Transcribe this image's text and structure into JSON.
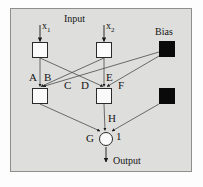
{
  "diagram": {
    "background_color": "#dededc",
    "line_color": "#4a4a4a",
    "node_fill": "#fbfbfb",
    "bias_fill": "#0a0a0a",
    "labels": {
      "input": "Input",
      "output": "Output",
      "bias": "Bias",
      "x1": "x",
      "x1_sub": "1",
      "x2": "x",
      "x2_sub": "2",
      "weight_a": "A",
      "weight_b": "B",
      "weight_c": "C",
      "weight_d": "D",
      "weight_e": "E",
      "weight_f": "F",
      "weight_g": "G",
      "weight_h": "H",
      "weight_one": "1"
    },
    "nodes": [
      {
        "id": "input-1",
        "type": "square",
        "x": 32,
        "y": 42,
        "w": 16,
        "h": 16
      },
      {
        "id": "input-2",
        "type": "square",
        "x": 96,
        "y": 42,
        "w": 16,
        "h": 16
      },
      {
        "id": "bias-top",
        "type": "square-filled",
        "x": 159,
        "y": 41,
        "w": 16,
        "h": 16
      },
      {
        "id": "hidden-1",
        "type": "square",
        "x": 32,
        "y": 88,
        "w": 16,
        "h": 16
      },
      {
        "id": "hidden-2",
        "type": "square",
        "x": 96,
        "y": 88,
        "w": 16,
        "h": 16
      },
      {
        "id": "bias-bottom",
        "type": "square-filled",
        "x": 159,
        "y": 88,
        "w": 16,
        "h": 16
      },
      {
        "id": "output-node",
        "type": "circle",
        "x": 99,
        "y": 132,
        "w": 14,
        "h": 14
      }
    ],
    "edges": [
      {
        "from": "input-1",
        "to": "hidden-1",
        "weight": "A"
      },
      {
        "from": "input-1",
        "to": "hidden-2",
        "weight": "C"
      },
      {
        "from": "input-2",
        "to": "hidden-1",
        "weight": "B"
      },
      {
        "from": "input-2",
        "to": "hidden-2",
        "weight": "D"
      },
      {
        "from": "bias-top",
        "to": "hidden-1",
        "weight": "E"
      },
      {
        "from": "bias-top",
        "to": "hidden-2",
        "weight": "F"
      },
      {
        "from": "hidden-1",
        "to": "output-node",
        "weight": "G"
      },
      {
        "from": "hidden-2",
        "to": "output-node",
        "weight": "H"
      },
      {
        "from": "bias-bottom",
        "to": "output-node",
        "weight": "1"
      }
    ]
  }
}
